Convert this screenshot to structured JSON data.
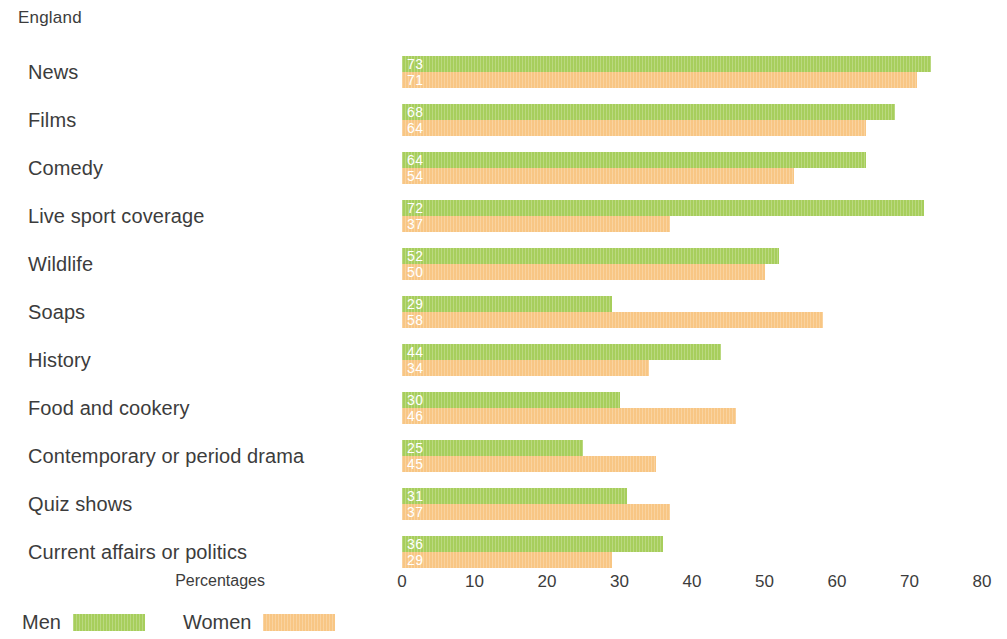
{
  "chart_data": {
    "type": "bar",
    "title": "England",
    "orientation": "horizontal",
    "xlabel": "Percentages",
    "ylabel": "",
    "xlim": [
      0,
      80
    ],
    "xticks": [
      0,
      10,
      20,
      30,
      40,
      50,
      60,
      70,
      80
    ],
    "grid": false,
    "legend_position": "bottom-left",
    "categories": [
      "News",
      "Films",
      "Comedy",
      "Live sport coverage",
      "Wildlife",
      "Soaps",
      "History",
      "Food and cookery",
      "Contemporary or period drama",
      "Quiz shows",
      "Current affairs or politics"
    ],
    "series": [
      {
        "name": "Men",
        "color": "#a7ce5c",
        "values": [
          73,
          68,
          64,
          72,
          52,
          29,
          44,
          30,
          25,
          31,
          36
        ],
        "drawn_values": [
          73,
          68,
          64,
          72,
          52,
          29,
          44,
          30,
          25,
          31,
          36
        ]
      },
      {
        "name": "Women",
        "color": "#f8c684",
        "values": [
          71,
          64,
          54,
          37,
          50,
          58,
          34,
          46,
          45,
          37,
          29
        ],
        "drawn_values": [
          71,
          64,
          54,
          37,
          50,
          58,
          34,
          46,
          35,
          37,
          29
        ]
      }
    ]
  },
  "legend": {
    "entries": [
      {
        "label": "Men",
        "color": "#a7ce5c"
      },
      {
        "label": "Women",
        "color": "#f8c684"
      }
    ]
  }
}
